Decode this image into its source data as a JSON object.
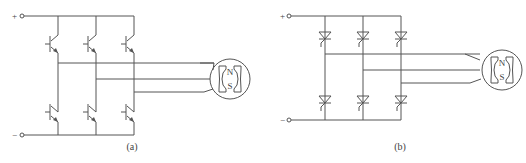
{
  "figure": {
    "panels": [
      {
        "id": "a",
        "caption": "(a)",
        "switch_type": "transistor",
        "terminals": {
          "positive": "+",
          "negative": "−"
        },
        "motor": {
          "north": "N",
          "south": "S"
        }
      },
      {
        "id": "b",
        "caption": "(b)",
        "switch_type": "thyristor",
        "terminals": {
          "positive": "+",
          "negative": "−"
        },
        "motor": {
          "north": "N",
          "south": "S"
        }
      }
    ],
    "colors": {
      "line": "#555555",
      "background": "#ffffff"
    }
  }
}
